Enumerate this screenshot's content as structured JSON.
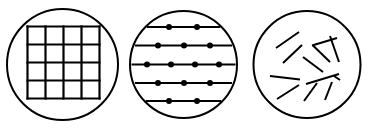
{
  "figure": {
    "name": "three-pattern-circles",
    "background_color": "#ffffff",
    "stroke_color": "#000000",
    "canvas": {
      "width": 368,
      "height": 129
    }
  },
  "panels": [
    {
      "id": "panel-grid",
      "label": "regular square lattice",
      "circle": {
        "cx": 62.5,
        "cy": 64.5,
        "r": 55.5,
        "stroke_width": 2.0
      },
      "pattern": {
        "type": "grid",
        "rows": 4,
        "columns": 4,
        "stroke_width": 2.2,
        "x_lines": [
          27.5,
          45.5,
          63.5,
          81.5,
          99.5
        ],
        "y_lines": [
          26.5,
          44.5,
          62.5,
          80.5,
          98.5
        ]
      }
    },
    {
      "id": "panel-lines-dots",
      "label": "horizontal lines with points",
      "circle": {
        "cx": 183.5,
        "cy": 64.5,
        "r": 53.5,
        "stroke_width": 2.0
      },
      "pattern": {
        "type": "horizontal-lines-with-dots",
        "line_count": 5,
        "stroke_width": 2.2,
        "dot_radius": 3.0,
        "rows": [
          {
            "y": 27.0,
            "x_start": 142.0,
            "x_end": 226.0,
            "dots": [
              169.0,
              197.0
            ]
          },
          {
            "y": 45.5,
            "x_start": 135.0,
            "x_end": 232.0,
            "dots": [
              158.0,
              184.0,
              210.0
            ]
          },
          {
            "y": 64.5,
            "x_start": 131.5,
            "x_end": 235.5,
            "dots": [
              147.0,
              171.0,
              195.0,
              219.0
            ]
          },
          {
            "y": 83.0,
            "x_start": 135.0,
            "x_end": 232.0,
            "dots": [
              158.0,
              184.0,
              210.0
            ]
          },
          {
            "y": 101.0,
            "x_start": 142.0,
            "x_end": 226.0,
            "dots": [
              169.0,
              197.0
            ]
          }
        ]
      }
    },
    {
      "id": "panel-random-segments",
      "label": "randomly oriented line segments",
      "circle": {
        "cx": 307.0,
        "cy": 64.5,
        "r": 53.5,
        "stroke_width": 2.0
      },
      "pattern": {
        "type": "random-segments",
        "segment_count": 12,
        "stroke_width": 2.0,
        "segments": [
          {
            "x1": 276.0,
            "y1": 48.0,
            "x2": 299.0,
            "y2": 32.0
          },
          {
            "x1": 283.0,
            "y1": 63.0,
            "x2": 302.0,
            "y2": 45.0
          },
          {
            "x1": 312.0,
            "y1": 45.5,
            "x2": 337.0,
            "y2": 38.0
          },
          {
            "x1": 313.0,
            "y1": 45.5,
            "x2": 330.0,
            "y2": 62.0
          },
          {
            "x1": 330.0,
            "y1": 36.0,
            "x2": 339.0,
            "y2": 62.0
          },
          {
            "x1": 303.0,
            "y1": 57.0,
            "x2": 323.0,
            "y2": 72.0
          },
          {
            "x1": 270.0,
            "y1": 76.0,
            "x2": 300.0,
            "y2": 79.5
          },
          {
            "x1": 306.0,
            "y1": 84.0,
            "x2": 339.0,
            "y2": 74.0
          },
          {
            "x1": 334.0,
            "y1": 76.0,
            "x2": 340.0,
            "y2": 80.0
          },
          {
            "x1": 277.0,
            "y1": 99.0,
            "x2": 299.0,
            "y2": 85.0
          },
          {
            "x1": 304.0,
            "y1": 101.0,
            "x2": 317.0,
            "y2": 83.0
          },
          {
            "x1": 325.0,
            "y1": 100.0,
            "x2": 332.0,
            "y2": 82.0
          }
        ]
      }
    }
  ]
}
